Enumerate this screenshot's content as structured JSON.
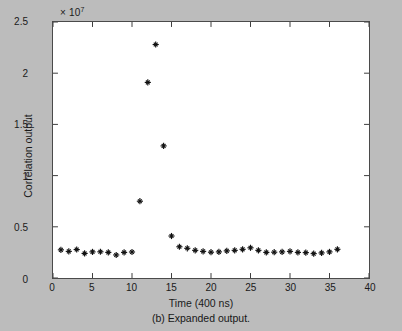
{
  "caption": "(b) Expanded output.",
  "chart_data": {
    "type": "scatter",
    "title": "",
    "caption": "(b) Expanded output.",
    "xlabel": "Time (400 ns)",
    "ylabel": "Correlation output",
    "y_multiplier_text": "× 10",
    "y_multiplier_exponent": "7",
    "y_scale": 10000000,
    "xlim": [
      0,
      40
    ],
    "ylim": [
      0,
      25000000
    ],
    "xticks": [
      0,
      5,
      10,
      15,
      20,
      25,
      30,
      35,
      40
    ],
    "xtick_labels": [
      "0",
      "5",
      "10",
      "15",
      "20",
      "25",
      "30",
      "35",
      "40"
    ],
    "yticks": [
      0,
      5000000,
      10000000,
      15000000,
      20000000,
      25000000
    ],
    "ytick_labels": [
      "0",
      "0.5",
      "1",
      "1.5",
      "2",
      "2.5"
    ],
    "grid": false,
    "legend": null,
    "marker": "plus",
    "marker_color": "#111111",
    "background_color": "#ffffff",
    "figure_background_color": "#bcbcbc",
    "series": [
      {
        "name": "Correlation output",
        "x": [
          1,
          2,
          3,
          4,
          5,
          6,
          7,
          8,
          9,
          10,
          11,
          12,
          13,
          14,
          15,
          16,
          17,
          18,
          19,
          20,
          21,
          22,
          23,
          24,
          25,
          26,
          27,
          28,
          29,
          30,
          31,
          32,
          33,
          34,
          35,
          36
        ],
        "y": [
          2750000,
          2600000,
          2780000,
          2400000,
          2550000,
          2560000,
          2500000,
          2250000,
          2500000,
          2540000,
          7500000,
          19100000,
          22800000,
          12900000,
          4100000,
          3050000,
          2900000,
          2700000,
          2600000,
          2520000,
          2550000,
          2650000,
          2700000,
          2800000,
          2950000,
          2700000,
          2500000,
          2520000,
          2550000,
          2600000,
          2500000,
          2480000,
          2380000,
          2450000,
          2550000,
          2800000
        ]
      }
    ],
    "peak": {
      "x": 13,
      "y": 22800000
    }
  }
}
